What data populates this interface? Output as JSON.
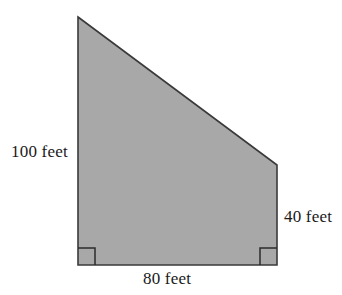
{
  "figure": {
    "name": "right-trapezoid",
    "fill_color": "#A8A8A8",
    "stroke_color": "#3A3A3A",
    "background_color": "#FFFFFF",
    "text_color": "#1A1A1A",
    "vertices": {
      "apex_top_left": [
        78,
        17
      ],
      "top_right": [
        277,
        165
      ],
      "bottom_right": [
        277,
        265
      ],
      "bottom_left": [
        78,
        265
      ]
    },
    "polygon_points": "78,17 277,165 277,265 78,265",
    "right_angle_marks": [
      {
        "name": "right-angle-bottom-left",
        "x": 78,
        "y": 248,
        "size": 17
      },
      {
        "name": "right-angle-bottom-right",
        "x": 260,
        "y": 248,
        "size": 17
      }
    ]
  },
  "labels": {
    "left": "100 feet",
    "right": "40 feet",
    "bottom": "80 feet"
  },
  "chart_data": {
    "type": "diagram",
    "shape": "right trapezoid",
    "title": "",
    "units": "feet",
    "sides": [
      {
        "name": "left-vertical-side",
        "label": "100 feet",
        "value": 100,
        "unit": "feet",
        "position": "left"
      },
      {
        "name": "right-vertical-side",
        "label": "40 feet",
        "value": 40,
        "unit": "feet",
        "position": "right"
      },
      {
        "name": "bottom-base",
        "label": "80 feet",
        "value": 80,
        "unit": "feet",
        "position": "bottom"
      },
      {
        "name": "hypotenuse",
        "label": "",
        "value": null,
        "unit": "feet",
        "position": "top-slanted"
      }
    ],
    "right_angles": 2,
    "grid": false,
    "legend": null
  }
}
